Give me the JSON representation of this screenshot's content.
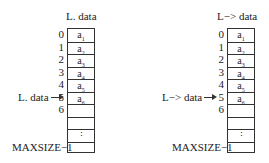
{
  "left": {
    "title": "L. data",
    "pointer_label": "L. data",
    "indices": [
      "0",
      "1",
      "2",
      "3",
      "4",
      "5",
      "6"
    ],
    "cells": [
      {
        "base": "a",
        "sub": "1"
      },
      {
        "base": "a",
        "sub": "2"
      },
      {
        "base": "a",
        "sub": "3"
      },
      {
        "base": "a",
        "sub": "4"
      },
      {
        "base": "a",
        "sub": "5"
      },
      {
        "base": "a",
        "sub": "6"
      }
    ],
    "ellipsis": "⋮",
    "max_label": "MAXSIZE−1"
  },
  "right": {
    "title": "L−> data",
    "pointer_label": "L−> data",
    "indices": [
      "0",
      "1",
      "2",
      "3",
      "4",
      "5",
      "6"
    ],
    "cells": [
      {
        "base": "a",
        "sub": "1"
      },
      {
        "base": "a",
        "sub": "2"
      },
      {
        "base": "a",
        "sub": "3"
      },
      {
        "base": "a",
        "sub": "4"
      },
      {
        "base": "a",
        "sub": "5"
      },
      {
        "base": "a",
        "sub": "6"
      }
    ],
    "ellipsis": "⋮",
    "max_label": "MAXSIZE−1"
  }
}
